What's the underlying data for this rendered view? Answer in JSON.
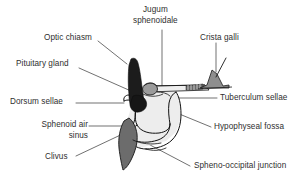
{
  "figure": {
    "background_color": "#ffffff",
    "line_color": "#1a1a1a",
    "text_color": "#2f2f2f"
  },
  "labels": [
    {
      "id": "optic-chiasm",
      "text": "Optic chiasm",
      "x": 44,
      "y": 34,
      "align": "left",
      "leader": {
        "x1": 98,
        "y1": 41,
        "x2": 127,
        "y2": 64
      }
    },
    {
      "id": "jugum-sphenoidale",
      "text_line1": "Jugum",
      "text_line2": "sphenoidale",
      "x": 133,
      "y": 6,
      "align": "left",
      "leader": {
        "x1": 162,
        "y1": 30,
        "x2": 162,
        "y2": 90
      }
    },
    {
      "id": "crista-galli",
      "text": "Crista galli",
      "x": 203,
      "y": 34,
      "align": "left",
      "leader": {
        "x1": 216,
        "y1": 43,
        "x2": 216,
        "y2": 72
      }
    },
    {
      "id": "pituitary-gland",
      "text": "Pituitary gland",
      "x": 16,
      "y": 60,
      "align": "left",
      "leader": {
        "x1": 79,
        "y1": 68,
        "x2": 131,
        "y2": 91
      }
    },
    {
      "id": "tuberculum-sellae",
      "text": "Tuberculum sellae",
      "x": 219,
      "y": 94,
      "align": "left",
      "leader": {
        "x1": 216,
        "y1": 98,
        "x2": 176,
        "y2": 98
      }
    },
    {
      "id": "dorsum-sellae",
      "text": "Dorsum sellae",
      "x": 10,
      "y": 98,
      "align": "left",
      "leader": {
        "x1": 76,
        "y1": 103,
        "x2": 124,
        "y2": 103
      }
    },
    {
      "id": "sphenoid-air-sinus",
      "text_line1": "Sphenoid air",
      "text_line2": "sinus",
      "x": 34,
      "y": 121,
      "align": "right",
      "leader": {
        "x1": 89,
        "y1": 126,
        "x2": 148,
        "y2": 126
      }
    },
    {
      "id": "hypophyseal-fossa",
      "text": "Hypophyseal fossa",
      "x": 213,
      "y": 123,
      "align": "left",
      "leader": {
        "x1": 211,
        "y1": 127,
        "x2": 176,
        "y2": 112
      }
    },
    {
      "id": "clivus",
      "text": "Clivus",
      "x": 45,
      "y": 153,
      "align": "left",
      "leader": {
        "x1": 76,
        "y1": 156,
        "x2": 129,
        "y2": 131
      }
    },
    {
      "id": "spheno-occipital-junction",
      "text": "Spheno-occipital junction",
      "x": 193,
      "y": 162,
      "align": "left",
      "leader": {
        "x1": 190,
        "y1": 166,
        "x2": 133,
        "y2": 136
      }
    }
  ],
  "structures": [
    {
      "id": "pituitary-stalk-gland",
      "name": "Pituitary gland (dark filled)",
      "fill": "#1c1c1c",
      "stroke": "#111111"
    },
    {
      "id": "optic-chiasm-body",
      "name": "Optic chiasm (grey oval)",
      "fill": "#9a9a9a",
      "stroke": "#222222"
    },
    {
      "id": "sella-turcica-outline",
      "name": "Sella turcica / hypophyseal fossa outline",
      "fill": "#ffffff",
      "stroke": "#111111"
    },
    {
      "id": "sphenoid-sinus-cavity",
      "name": "Sphenoid air sinus cavity",
      "fill": "#ffffff",
      "stroke": "#111111"
    },
    {
      "id": "sphenoid-body-shade",
      "name": "Sphenoid body shading",
      "fill": "#ececec",
      "stroke": "#111111"
    },
    {
      "id": "clivus-wedge",
      "name": "Clivus (dark grey wedge)",
      "fill": "#6e6e6e",
      "stroke": "#1a1a1a"
    },
    {
      "id": "crista-galli-peak",
      "name": "Crista galli (grey triangular peak)",
      "fill": "#8f8f8f",
      "stroke": "#1a1a1a"
    },
    {
      "id": "planum-sphenoidale-plate",
      "name": "Planum / jugum sphenoidale plate",
      "fill": "#efefef",
      "stroke": "#111111"
    },
    {
      "id": "cribriform-plate-hatch",
      "name": "Cribriform plate hatching",
      "fill": "#555555",
      "stroke": "#222222"
    }
  ]
}
